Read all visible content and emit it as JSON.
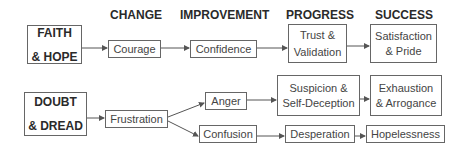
{
  "headers": [
    "CHANGE",
    "IMPROVEMENT",
    "PROGRESS",
    "SUCCESS"
  ],
  "top_row": {
    "source": {
      "line1": "FAITH",
      "line2": "& HOPE"
    },
    "nodes": [
      {
        "line1": "Courage"
      },
      {
        "line1": "Confidence"
      },
      {
        "line1": "Trust &",
        "line2": "Validation"
      },
      {
        "line1": "Satisfaction",
        "line2": "& Pride"
      }
    ]
  },
  "bottom_row": {
    "source": {
      "line1": "DOUBT",
      "line2": "& DREAD"
    },
    "frustration": "Frustration",
    "anger": "Anger",
    "confusion": "Confusion",
    "suspicion": {
      "line1": "Suspicion &",
      "line2": "Self-Deception"
    },
    "exhaustion": {
      "line1": "Exhaustion",
      "line2": "& Arrogance"
    },
    "desperation": "Desperation",
    "hopelessness": "Hopelessness"
  },
  "colors": {
    "border": "#666666",
    "text": "#444444",
    "heading": "#2a2a2a",
    "arrow": "#555555"
  }
}
